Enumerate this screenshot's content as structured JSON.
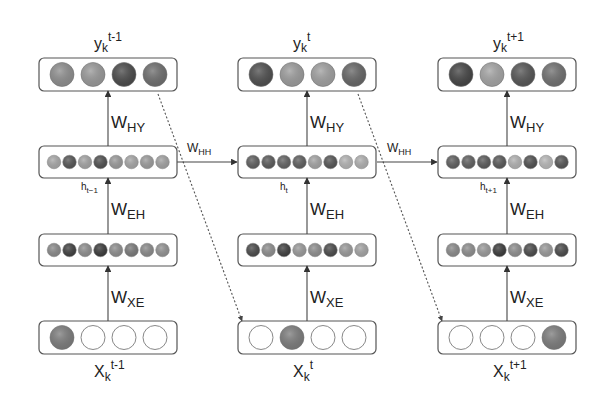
{
  "diagram": {
    "type": "unrolled-recurrent-neural-network",
    "edge_labels": {
      "hidden_to_output": "W",
      "hidden_to_output_sub": "HY",
      "embedding_to_hidden": "W",
      "embedding_to_hidden_sub": "EH",
      "input_to_embedding": "W",
      "input_to_embedding_sub": "XE",
      "hidden_to_hidden": "W",
      "hidden_to_hidden_sub": "HH"
    },
    "columns": [
      {
        "output_label": "y",
        "output_sub": "k",
        "output_sup": "t-1",
        "hidden_label": "h",
        "hidden_sub": "t−1",
        "input_label": "X",
        "input_sub": "k",
        "input_sup": "t-1",
        "output_nodes": [
          "#8e8e8e",
          "#999999",
          "#4a4a4a",
          "#6e6e6e"
        ],
        "hidden_nodes": [
          "#a8a8a8",
          "#555555",
          "#a4a4a4",
          "#4f4f4f",
          "#9a9a9a",
          "#a6a6a6",
          "#9c9c9c",
          "#a2a2a2"
        ],
        "embedding_nodes": [
          "#8a8a8a",
          "#3f3f3f",
          "#8e8e8e",
          "#3a3a3a",
          "#8e8e8e",
          "#7a7a7a",
          "#8a8a8a",
          "#929292"
        ],
        "input_nodes": [
          "#7c7c7c",
          "#ffffff",
          "#ffffff",
          "#ffffff"
        ]
      },
      {
        "output_label": "y",
        "output_sub": "k",
        "output_sup": "t",
        "hidden_label": "h",
        "hidden_sub": "t",
        "input_label": "X",
        "input_sub": "k",
        "input_sup": "t",
        "output_nodes": [
          "#4e4e4e",
          "#9c9c9c",
          "#a0a0a0",
          "#666666"
        ],
        "hidden_nodes": [
          "#5e5e5e",
          "#5a5a5a",
          "#626262",
          "#5e5e5e",
          "#a4a4a4",
          "#555555",
          "#b4b4b4",
          "#b0b0b0"
        ],
        "embedding_nodes": [
          "#4a4a4a",
          "#8e8e8e",
          "#3f3f3f",
          "#9a9a9a",
          "#8e8e8e",
          "#4a4a4a",
          "#9a9a9a",
          "#a4a4a4"
        ],
        "input_nodes": [
          "#ffffff",
          "#7c7c7c",
          "#ffffff",
          "#ffffff"
        ]
      },
      {
        "output_label": "y",
        "output_sub": "k",
        "output_sup": "t+1",
        "hidden_label": "h",
        "hidden_sub": "t+1",
        "input_label": "X",
        "input_sub": "k",
        "input_sup": "t+1",
        "output_nodes": [
          "#444444",
          "#a4a4a4",
          "#555555",
          "#707070"
        ],
        "hidden_nodes": [
          "#5e5e5e",
          "#606060",
          "#5a5a5a",
          "#585858",
          "#b2b2b2",
          "#505050",
          "#b8b8b8",
          "#555555"
        ],
        "embedding_nodes": [
          "#8a8a8a",
          "#8e8e8e",
          "#9a9a9a",
          "#3a3a3a",
          "#8e8e8e",
          "#4a4a4a",
          "#9a9a9a",
          "#4a4a4a"
        ],
        "input_nodes": [
          "#ffffff",
          "#ffffff",
          "#ffffff",
          "#7c7c7c"
        ]
      }
    ],
    "colors": {
      "box_stroke": "#555555",
      "edge": "#444444",
      "dashed_edge": "#666666",
      "empty_node_stroke": "#888888"
    }
  }
}
